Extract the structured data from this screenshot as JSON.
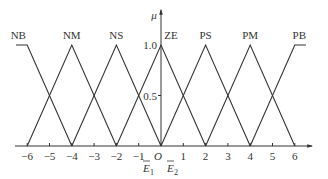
{
  "chart_data": {
    "type": "line",
    "title": "",
    "xlabel": "",
    "ylabel": "μ",
    "xlim": [
      -6,
      6
    ],
    "ylim": [
      0,
      1.0
    ],
    "grid": false,
    "x_ticks": [
      "-6",
      "-5",
      "-4",
      "-3",
      "-2",
      "-1",
      "O",
      "1",
      "2",
      "3",
      "4",
      "5",
      "6"
    ],
    "y_ticks": [
      "0.5",
      "1.0"
    ],
    "series": [
      {
        "name": "NB",
        "points": [
          [
            -6.5,
            1
          ],
          [
            -6,
            1
          ],
          [
            -4,
            0
          ]
        ]
      },
      {
        "name": "NM",
        "points": [
          [
            -6,
            0
          ],
          [
            -4,
            1
          ],
          [
            -2,
            0
          ]
        ]
      },
      {
        "name": "NS",
        "points": [
          [
            -4,
            0
          ],
          [
            -2,
            1
          ],
          [
            0,
            0
          ]
        ]
      },
      {
        "name": "ZE",
        "points": [
          [
            -2,
            0
          ],
          [
            0,
            1
          ],
          [
            2,
            0
          ]
        ]
      },
      {
        "name": "PS",
        "points": [
          [
            0,
            0
          ],
          [
            2,
            1
          ],
          [
            4,
            0
          ]
        ]
      },
      {
        "name": "PM",
        "points": [
          [
            2,
            0
          ],
          [
            4,
            1
          ],
          [
            6,
            0
          ]
        ]
      },
      {
        "name": "PB",
        "points": [
          [
            4,
            0
          ],
          [
            6,
            1
          ],
          [
            6.5,
            1
          ]
        ]
      }
    ],
    "annotations": [
      "Ē1",
      "Ē2"
    ]
  },
  "labels": {
    "y_axis": "μ",
    "origin": "O",
    "y_one": "1.0",
    "y_half": "0.5",
    "e1_base": "E",
    "e1_sub": "1",
    "e2_base": "E",
    "e2_sub": "2"
  }
}
